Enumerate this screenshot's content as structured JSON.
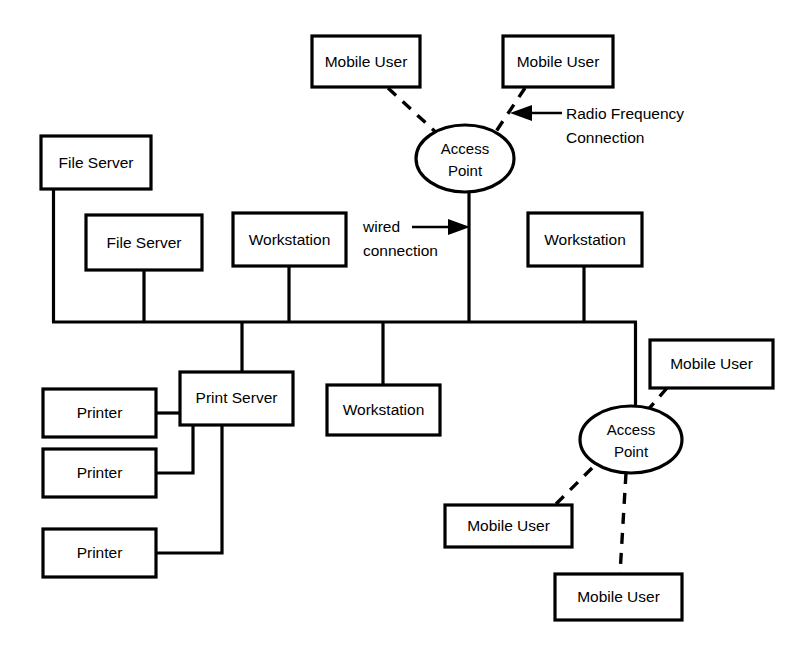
{
  "diagram": {
    "background_color": "#ffffff",
    "line_color": "#000000",
    "nodes": {
      "mobile_user_top_left": {
        "label": "Mobile User",
        "type": "box"
      },
      "mobile_user_top_right": {
        "label": "Mobile User",
        "type": "box"
      },
      "access_point_top": {
        "label_line1": "Access",
        "label_line2": "Point",
        "type": "ellipse"
      },
      "file_server_1": {
        "label": "File Server",
        "type": "box"
      },
      "file_server_2": {
        "label": "File Server",
        "type": "box"
      },
      "workstation_1": {
        "label": "Workstation",
        "type": "box"
      },
      "workstation_2": {
        "label": "Workstation",
        "type": "box"
      },
      "workstation_3": {
        "label": "Workstation",
        "type": "box"
      },
      "print_server": {
        "label": "Print Server",
        "type": "box"
      },
      "printer_1": {
        "label": "Printer",
        "type": "box"
      },
      "printer_2": {
        "label": "Printer",
        "type": "box"
      },
      "printer_3": {
        "label": "Printer",
        "type": "box"
      },
      "access_point_bottom": {
        "label_line1": "Access",
        "label_line2": "Point",
        "type": "ellipse"
      },
      "mobile_user_right": {
        "label": "Mobile User",
        "type": "box"
      },
      "mobile_user_bottom_left": {
        "label": "Mobile User",
        "type": "box"
      },
      "mobile_user_bottom": {
        "label": "Mobile User",
        "type": "box"
      }
    },
    "annotations": {
      "radio_frequency_line1": "Radio Frequency",
      "radio_frequency_line2": "Connection",
      "wired_line1": "wired",
      "wired_line2": "connection"
    },
    "legend": {
      "solid_line_meaning": "wired connection",
      "dashed_line_meaning": "Radio Frequency Connection"
    }
  }
}
